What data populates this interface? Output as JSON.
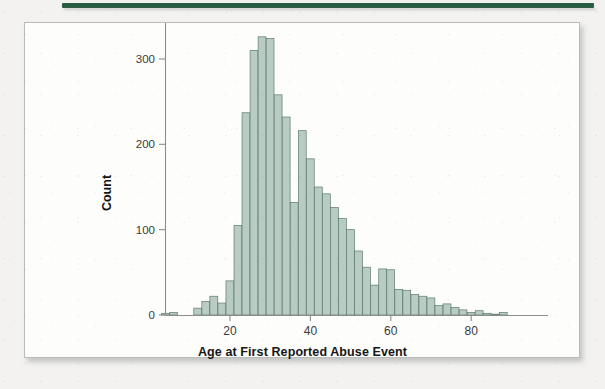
{
  "page": {
    "background_color": "#f3f2f0",
    "rule_color": "#255c42",
    "panel_background": "#fdfdfc",
    "panel_border_color": "#b9bcb8"
  },
  "figure": {
    "xaxis_title": "Age at First Reported Abuse Event",
    "yaxis_title": "Count"
  },
  "chart_data": {
    "type": "bar",
    "title": "",
    "subtitle": "",
    "xlabel": "Age at First Reported Abuse Event",
    "ylabel": "Count",
    "bin_width": 2,
    "xlim": [
      0,
      92
    ],
    "ylim": [
      0,
      340
    ],
    "xticks": [
      20,
      40,
      60,
      80
    ],
    "yticks": [
      0,
      100,
      200,
      300
    ],
    "xtick_labels": [
      "20",
      "40",
      "60",
      "80"
    ],
    "ytick_labels": [
      "0",
      "100",
      "200",
      "300"
    ],
    "grid": false,
    "legend": "none",
    "bar_fill_color": "#b9ccc3",
    "bar_edge_color": "#5c7a6e",
    "axis_color": "#8d8d8d",
    "categories": [
      "4",
      "6",
      "8",
      "10",
      "12",
      "14",
      "16",
      "18",
      "20",
      "22",
      "24",
      "26",
      "28",
      "30",
      "32",
      "34",
      "36",
      "38",
      "40",
      "42",
      "44",
      "46",
      "48",
      "50",
      "52",
      "54",
      "56",
      "58",
      "60",
      "62",
      "64",
      "66",
      "68",
      "70",
      "72",
      "74",
      "76",
      "78",
      "80",
      "82",
      "84",
      "86",
      "88"
    ],
    "values": [
      2,
      3,
      0,
      0,
      8,
      16,
      22,
      14,
      40,
      105,
      237,
      310,
      326,
      324,
      258,
      232,
      132,
      216,
      183,
      150,
      142,
      126,
      113,
      100,
      75,
      56,
      35,
      54,
      53,
      30,
      29,
      24,
      22,
      20,
      11,
      13,
      9,
      6,
      3,
      5,
      2,
      1,
      3
    ]
  }
}
